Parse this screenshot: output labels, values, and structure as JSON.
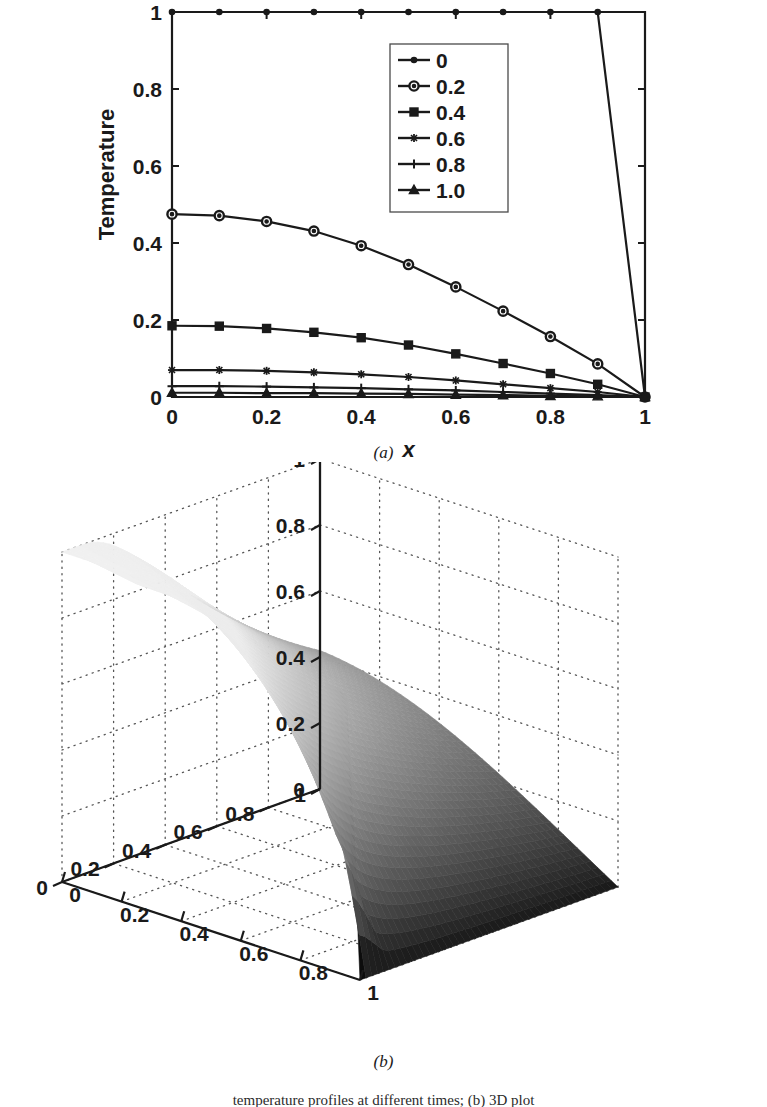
{
  "figure": {
    "panel_a_caption": "(a)",
    "panel_b_caption": "(b)",
    "bottom_caption": "temperature profiles at different times; (b) 3D plot"
  },
  "chart_data": [
    {
      "id": "panel-a",
      "type": "line",
      "title": "",
      "xlabel": "x",
      "ylabel": "Temperature",
      "xlim": [
        0,
        1
      ],
      "ylim": [
        0,
        1
      ],
      "xticks": [
        0,
        0.2,
        0.4,
        0.6,
        0.8,
        1
      ],
      "xticklabels": [
        "0",
        "0.2",
        "0.4",
        "0.6",
        "0.8",
        "1"
      ],
      "yticks": [
        0,
        0.2,
        0.4,
        0.6,
        0.8,
        1
      ],
      "yticklabels": [
        "0",
        "0.2",
        "0.4",
        "0.6",
        "0.8",
        "1"
      ],
      "grid": false,
      "legend_position": "upper-center",
      "legend_title": "",
      "x": [
        0,
        0.1,
        0.2,
        0.3,
        0.4,
        0.5,
        0.6,
        0.7,
        0.8,
        0.9,
        1.0
      ],
      "series": [
        {
          "name": "0",
          "marker": "dot",
          "values": [
            1.0,
            1.0,
            1.0,
            1.0,
            1.0,
            1.0,
            1.0,
            1.0,
            1.0,
            1.0,
            0.0
          ]
        },
        {
          "name": "0.2",
          "marker": "circle",
          "values": [
            0.475,
            0.471,
            0.456,
            0.431,
            0.393,
            0.344,
            0.286,
            0.223,
            0.157,
            0.086,
            0.0
          ]
        },
        {
          "name": "0.4",
          "marker": "square",
          "values": [
            0.185,
            0.184,
            0.178,
            0.168,
            0.154,
            0.135,
            0.112,
            0.087,
            0.061,
            0.033,
            0.0
          ]
        },
        {
          "name": "0.6",
          "marker": "star",
          "values": [
            0.07,
            0.07,
            0.068,
            0.064,
            0.059,
            0.052,
            0.043,
            0.033,
            0.023,
            0.013,
            0.0
          ]
        },
        {
          "name": "0.8",
          "marker": "plus",
          "values": [
            0.028,
            0.028,
            0.027,
            0.025,
            0.023,
            0.02,
            0.017,
            0.013,
            0.009,
            0.005,
            0.0
          ]
        },
        {
          "name": "1.0",
          "marker": "triangle",
          "values": [
            0.011,
            0.011,
            0.01,
            0.01,
            0.009,
            0.008,
            0.006,
            0.005,
            0.003,
            0.002,
            0.0
          ]
        }
      ]
    },
    {
      "id": "panel-b",
      "type": "surface",
      "title": "",
      "xlabel": "",
      "ylabel": "",
      "zlabel": "",
      "xlim": [
        0,
        1
      ],
      "ylim": [
        0,
        1
      ],
      "zlim": [
        0,
        1
      ],
      "zticks": [
        0,
        0.2,
        0.4,
        0.6,
        0.8,
        1
      ],
      "zticklabels": [
        "0",
        "0.2",
        "0.4",
        "0.6",
        "0.8",
        "1"
      ],
      "left_axis_ticks": [
        1,
        0.8,
        0.6,
        0.4,
        0.2,
        0
      ],
      "left_axis_ticklabels": [
        "1",
        "0.8",
        "0.6",
        "0.4",
        "0.2",
        "0"
      ],
      "right_axis_ticks": [
        0,
        0.2,
        0.4,
        0.6,
        0.8,
        1
      ],
      "right_axis_ticklabels": [
        "0",
        "0.2",
        "0.4",
        "0.6",
        "0.8",
        "1"
      ],
      "grid": true,
      "colormap": "gray",
      "description": "Surface u(x,t): unity ridge at t=0 decaying to zero at x=1 and with increasing t"
    }
  ],
  "colors": {
    "axis": "#1a1a1a",
    "line": "#1a1a1a",
    "grid_dot": "#555555",
    "surface_light": "#ffffff",
    "surface_dark": "#1c1c1c",
    "background": "#ffffff"
  }
}
